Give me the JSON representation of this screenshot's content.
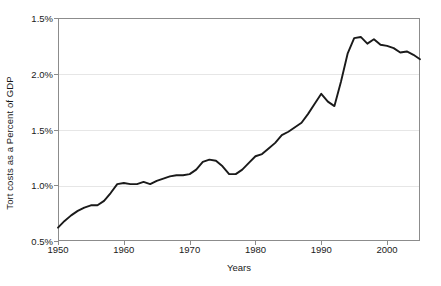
{
  "chart_data": {
    "type": "line",
    "title": "",
    "xlabel": "Years",
    "ylabel": "Tort costs as a Percent of GDP",
    "xlim": [
      1950,
      2005
    ],
    "ylim": [
      0.5,
      2.5
    ],
    "grid": true,
    "legend": null,
    "x_tick_labels": [
      "1950",
      "1960",
      "1970",
      "1980",
      "1990",
      "2000"
    ],
    "x_ticks": [
      1950,
      1960,
      1970,
      1980,
      1990,
      2000
    ],
    "y_tick_labels": [
      "0.5%",
      "1.0%",
      "1.5%",
      "2.0%",
      "1.5%"
    ],
    "y_ticks": [
      0.5,
      1.0,
      1.5,
      2.0,
      2.5
    ],
    "line_color": "#1a1a1a",
    "series": [
      {
        "name": "Tort costs as a Percent of GDP",
        "x": [
          1950,
          1951,
          1952,
          1953,
          1954,
          1955,
          1956,
          1957,
          1958,
          1959,
          1960,
          1961,
          1962,
          1963,
          1964,
          1965,
          1966,
          1967,
          1968,
          1969,
          1970,
          1971,
          1972,
          1973,
          1974,
          1975,
          1976,
          1977,
          1978,
          1979,
          1980,
          1981,
          1982,
          1983,
          1984,
          1985,
          1986,
          1987,
          1988,
          1989,
          1990,
          1991,
          1992,
          1993,
          1994,
          1995,
          1996,
          1997,
          1998,
          1999,
          2000,
          2001,
          2002,
          2003,
          2004,
          2005
        ],
        "values": [
          0.62,
          0.68,
          0.73,
          0.77,
          0.8,
          0.82,
          0.82,
          0.86,
          0.93,
          1.01,
          1.02,
          1.01,
          1.01,
          1.03,
          1.01,
          1.04,
          1.06,
          1.08,
          1.09,
          1.09,
          1.1,
          1.14,
          1.21,
          1.23,
          1.22,
          1.17,
          1.1,
          1.1,
          1.14,
          1.2,
          1.26,
          1.28,
          1.33,
          1.38,
          1.45,
          1.48,
          1.52,
          1.56,
          1.64,
          1.73,
          1.82,
          1.75,
          1.71,
          1.93,
          2.18,
          2.32,
          2.33,
          2.27,
          2.31,
          2.26,
          2.25,
          2.23,
          2.19,
          2.2,
          2.17,
          2.13
        ]
      }
    ],
    "annotations": []
  },
  "axis": {
    "y_title": "Tort costs as a Percent of GDP",
    "x_title": "Years"
  }
}
